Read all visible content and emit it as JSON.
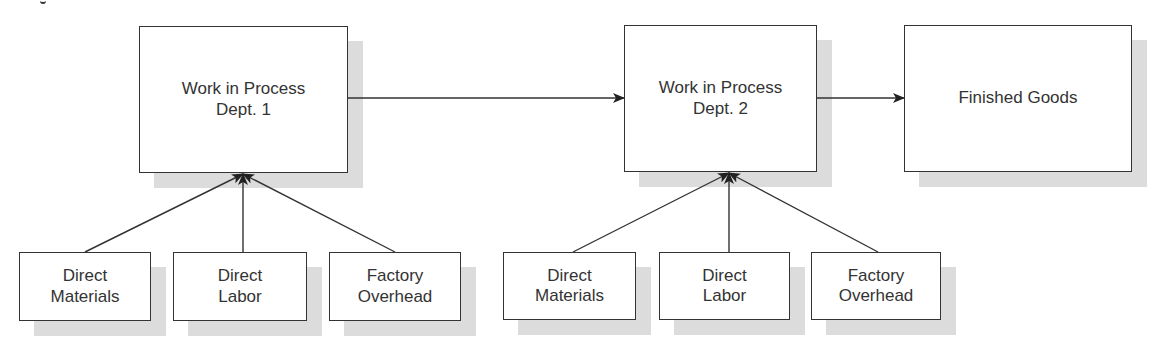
{
  "diagram": {
    "stage1": {
      "line1": "Work in Process",
      "line2": "Dept. 1"
    },
    "stage2": {
      "line1": "Work in Process",
      "line2": "Dept. 2"
    },
    "finished": {
      "label": "Finished Goods"
    },
    "inputs1": [
      {
        "line1": "Direct",
        "line2": "Materials"
      },
      {
        "line1": "Direct",
        "line2": "Labor"
      },
      {
        "line1": "Factory",
        "line2": "Overhead"
      }
    ],
    "inputs2": [
      {
        "line1": "Direct",
        "line2": "Materials"
      },
      {
        "line1": "Direct",
        "line2": "Labor"
      },
      {
        "line1": "Factory",
        "line2": "Overhead"
      }
    ]
  },
  "colors": {
    "stroke": "#333333",
    "shadow": "#dcdcdc"
  }
}
